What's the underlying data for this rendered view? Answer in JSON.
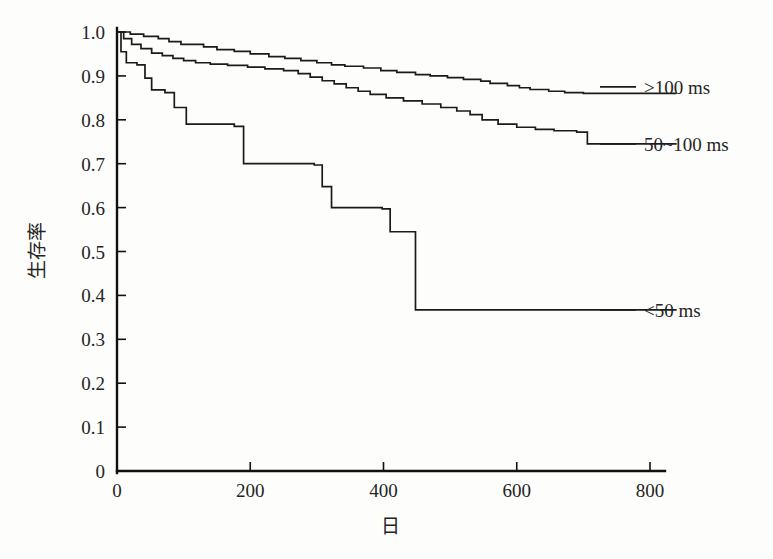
{
  "chart_data": {
    "type": "line",
    "subtype": "kaplan-meier-step",
    "title": "",
    "subtitle": "",
    "xlabel": "日",
    "ylabel": "生存率",
    "xlim": [
      0,
      840
    ],
    "ylim": [
      0,
      1.0
    ],
    "xticks": [
      0,
      200,
      400,
      600,
      800
    ],
    "xtick_labels": [
      "0",
      "200",
      "400",
      "600",
      "800"
    ],
    "yticks": [
      0,
      0.1,
      0.2,
      0.3,
      0.4,
      0.5,
      0.6,
      0.7,
      0.8,
      0.9,
      1.0
    ],
    "ytick_labels": [
      "0",
      "0.1",
      "0.2",
      "0.3",
      "0.4",
      "0.5",
      "0.6",
      "0.7",
      "0.8",
      "0.9",
      "1.0"
    ],
    "grid": false,
    "legend_position": "right-inline",
    "line_color": "#1b1b1b",
    "series": [
      {
        "name": ">100 ms",
        "legend_label": ">100 ms",
        "legend_y_value": 0.875,
        "final_value": 0.86,
        "steps": [
          [
            0,
            1.0
          ],
          [
            20,
            0.995
          ],
          [
            40,
            0.99
          ],
          [
            62,
            0.985
          ],
          [
            78,
            0.978
          ],
          [
            96,
            0.972
          ],
          [
            130,
            0.966
          ],
          [
            150,
            0.96
          ],
          [
            176,
            0.956
          ],
          [
            200,
            0.95
          ],
          [
            228,
            0.944
          ],
          [
            252,
            0.94
          ],
          [
            276,
            0.935
          ],
          [
            300,
            0.93
          ],
          [
            322,
            0.925
          ],
          [
            342,
            0.922
          ],
          [
            370,
            0.918
          ],
          [
            396,
            0.912
          ],
          [
            420,
            0.908
          ],
          [
            448,
            0.903
          ],
          [
            470,
            0.9
          ],
          [
            496,
            0.896
          ],
          [
            520,
            0.892
          ],
          [
            546,
            0.888
          ],
          [
            560,
            0.883
          ],
          [
            586,
            0.878
          ],
          [
            604,
            0.873
          ],
          [
            620,
            0.869
          ],
          [
            648,
            0.865
          ],
          [
            672,
            0.862
          ],
          [
            700,
            0.86
          ],
          [
            840,
            0.86
          ]
        ]
      },
      {
        "name": "50~100 ms",
        "legend_label": "50~100 ms",
        "legend_y_value": 0.745,
        "final_value": 0.745,
        "steps": [
          [
            0,
            1.0
          ],
          [
            10,
            0.985
          ],
          [
            22,
            0.972
          ],
          [
            36,
            0.962
          ],
          [
            52,
            0.952
          ],
          [
            68,
            0.946
          ],
          [
            84,
            0.94
          ],
          [
            100,
            0.935
          ],
          [
            118,
            0.93
          ],
          [
            140,
            0.927
          ],
          [
            166,
            0.924
          ],
          [
            196,
            0.92
          ],
          [
            222,
            0.916
          ],
          [
            250,
            0.912
          ],
          [
            272,
            0.905
          ],
          [
            290,
            0.897
          ],
          [
            308,
            0.889
          ],
          [
            326,
            0.882
          ],
          [
            344,
            0.873
          ],
          [
            362,
            0.865
          ],
          [
            380,
            0.858
          ],
          [
            404,
            0.85
          ],
          [
            430,
            0.843
          ],
          [
            458,
            0.836
          ],
          [
            486,
            0.828
          ],
          [
            510,
            0.82
          ],
          [
            530,
            0.812
          ],
          [
            548,
            0.8
          ],
          [
            572,
            0.79
          ],
          [
            600,
            0.783
          ],
          [
            628,
            0.778
          ],
          [
            656,
            0.775
          ],
          [
            690,
            0.772
          ],
          [
            706,
            0.745
          ],
          [
            840,
            0.745
          ]
        ]
      },
      {
        "name": "<50 ms",
        "legend_label": "<50 ms",
        "legend_y_value": 0.367,
        "final_value": 0.367,
        "steps": [
          [
            0,
            1.0
          ],
          [
            6,
            0.955
          ],
          [
            14,
            0.93
          ],
          [
            30,
            0.925
          ],
          [
            42,
            0.895
          ],
          [
            52,
            0.868
          ],
          [
            72,
            0.862
          ],
          [
            86,
            0.828
          ],
          [
            104,
            0.79
          ],
          [
            176,
            0.785
          ],
          [
            190,
            0.7
          ],
          [
            296,
            0.697
          ],
          [
            308,
            0.648
          ],
          [
            322,
            0.6
          ],
          [
            398,
            0.597
          ],
          [
            410,
            0.545
          ],
          [
            448,
            0.367
          ],
          [
            840,
            0.367
          ]
        ]
      }
    ]
  },
  "axes": {
    "y_axis_name": "survival-rate-axis",
    "x_axis_name": "days-axis"
  },
  "legend": {
    "entries": [
      {
        "label": ">100 ms",
        "series": ">100 ms"
      },
      {
        "label": "50~100 ms",
        "series": "50~100 ms"
      },
      {
        "label": "<50 ms",
        "series": "<50 ms"
      }
    ]
  }
}
